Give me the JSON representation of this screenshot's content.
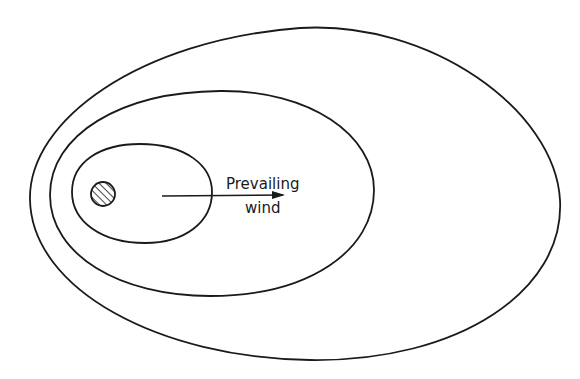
{
  "diagram": {
    "labels": {
      "wind_line1": "Prevailing",
      "wind_line2": "wind"
    },
    "elements": [
      {
        "name": "source",
        "shape": "hatched circle"
      },
      {
        "name": "inner-contour",
        "shape": "egg-shaped closed curve"
      },
      {
        "name": "middle-contour",
        "shape": "egg-shaped closed curve"
      },
      {
        "name": "outer-contour",
        "shape": "egg-shaped closed curve"
      },
      {
        "name": "wind-arrow",
        "direction": "right"
      }
    ],
    "colors": {
      "line": "#1a1a1a",
      "background": "#ffffff"
    }
  }
}
